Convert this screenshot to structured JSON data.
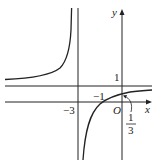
{
  "diagram": {
    "type": "function-graph",
    "function": "y = (x+1)/(x+3)",
    "axes": {
      "x_label": "x",
      "y_label": "y",
      "origin_label": "O"
    },
    "asymptotes": {
      "vertical": "x = -3",
      "horizontal": "y = 1"
    },
    "labels": {
      "vertical_asymptote": "−3",
      "horizontal_asymptote": "1",
      "x_intercept": "−1",
      "y_intercept_num": "1",
      "y_intercept_den": "3"
    },
    "colors": {
      "line": "#222222",
      "background": "#ffffff"
    }
  }
}
